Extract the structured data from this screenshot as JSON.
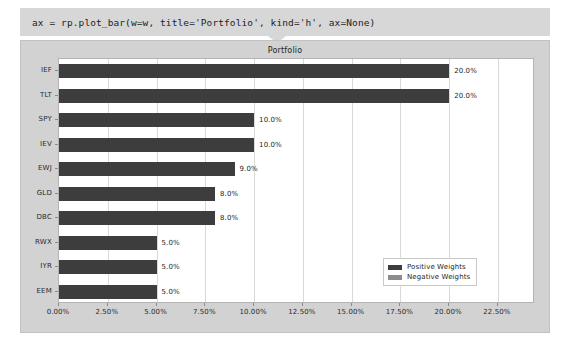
{
  "notebook": {
    "code_cell": {
      "source": "ax = rp.plot_bar(w=w, title='Portfolio', kind='h', ax=None)"
    }
  },
  "chart_data": {
    "type": "bar",
    "orientation": "horizontal",
    "title": "Portfolio",
    "xlabel": "",
    "ylabel": "",
    "categories": [
      "EEM",
      "IYR",
      "RWX",
      "DBC",
      "GLD",
      "EWJ",
      "IEV",
      "SPY",
      "TLT",
      "IEF"
    ],
    "values": [
      5.0,
      5.0,
      5.0,
      8.0,
      8.0,
      9.0,
      10.0,
      10.0,
      20.0,
      20.0
    ],
    "data_labels": [
      "5.0%",
      "5.0%",
      "5.0%",
      "8.0%",
      "8.0%",
      "9.0%",
      "10.0%",
      "10.0%",
      "20.0%",
      "20.0%"
    ],
    "xlim": [
      0.0,
      24.4
    ],
    "xticks": [
      0.0,
      2.5,
      5.0,
      7.5,
      10.0,
      12.5,
      15.0,
      17.5,
      20.0,
      22.5
    ],
    "xticklabels": [
      "0.00%",
      "2.50%",
      "5.00%",
      "7.50%",
      "10.00%",
      "12.50%",
      "15.00%",
      "17.50%",
      "20.00%",
      "22.50%"
    ],
    "grid": true,
    "grid_axis": "x",
    "legend": {
      "position": "lower right",
      "entries": [
        {
          "label": "Positive Weights",
          "color": "#3d3d3d"
        },
        {
          "label": "Negative Weights",
          "color": "#8c8c8c"
        }
      ]
    },
    "bar_color": "#3d3d3d",
    "figure_facecolor": "#d2d2d2",
    "axes_facecolor": "#ffffff"
  }
}
